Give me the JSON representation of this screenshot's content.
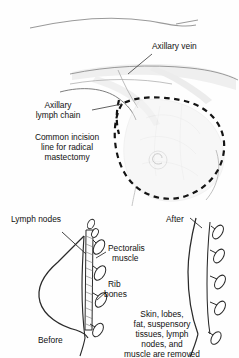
{
  "figure": {
    "background_color": "#fefefe",
    "ink_color": "#1a1a1a",
    "faint_tissue_color": "#d8d8d8"
  },
  "top_panel": {
    "labels": {
      "axillary_vein": "Axillary vein",
      "axillary_lymph_chain_line1": "Axillary",
      "axillary_lymph_chain_line2": "lymph chain",
      "incision_line1": "Common incision",
      "incision_line2": "line for radical",
      "incision_line3": "mastectomy"
    }
  },
  "bottom_panel": {
    "labels": {
      "lymph_nodes": "Lymph nodes",
      "pectoralis_line1": "Pectoralis",
      "pectoralis_line2": "muscle",
      "rib_line1": "Rib",
      "rib_line2": "bones",
      "before": "Before",
      "after": "After",
      "removed_line1": "Skin, lobes,",
      "removed_line2": "fat, suspensory",
      "removed_line3": "tissues, lymph",
      "removed_line4": "nodes, and",
      "removed_line5": "muscle are removed"
    }
  }
}
